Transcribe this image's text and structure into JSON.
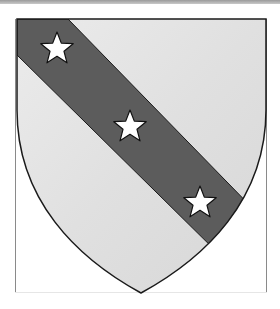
{
  "image": {
    "subject": "heraldic-shield",
    "description": "Shield with a diagonal bend bearing three five-pointed stars",
    "colors": {
      "field": "#e2e2e2",
      "field_highlight": "#f4f4f4",
      "bend": "#5c5c5c",
      "star": "#ffffff",
      "outline": "#1a1a1a",
      "frame_line": "#8a8a8a",
      "top_bar": "#a8a8a8"
    },
    "charges": [
      {
        "type": "star",
        "cx": 57,
        "cy": 49
      },
      {
        "type": "star",
        "cx": 130,
        "cy": 127
      },
      {
        "type": "star",
        "cx": 200,
        "cy": 203
      }
    ]
  }
}
